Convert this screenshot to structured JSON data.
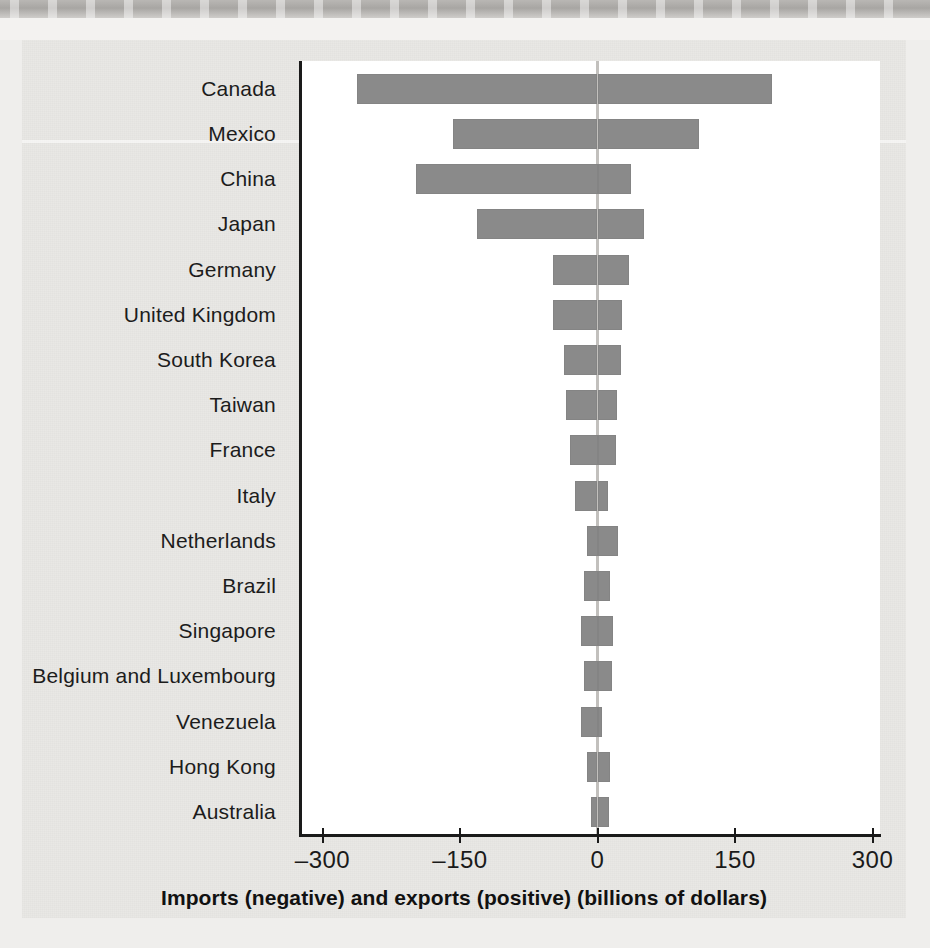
{
  "chart_data": {
    "type": "bar",
    "orientation": "horizontal",
    "title": "",
    "xlabel": "Imports (negative) and exports (positive) (billions of dollars)",
    "ylabel": "",
    "xlim": [
      -300,
      300
    ],
    "xticks": [
      -300,
      -150,
      0,
      150,
      300
    ],
    "xticklabels": [
      "–300",
      "–150",
      "0",
      "150",
      "300"
    ],
    "grid": false,
    "legend": null,
    "zero_line": 0,
    "bar_color": "#8a8a8a",
    "categories": [
      "Canada",
      "Mexico",
      "China",
      "Japan",
      "Germany",
      "United Kingdom",
      "South Korea",
      "Taiwan",
      "France",
      "Italy",
      "Netherlands",
      "Brazil",
      "Singapore",
      "Belgium and Luxembourg",
      "Venezuela",
      "Hong Kong",
      "Australia"
    ],
    "series": [
      {
        "name": "Imports (negative)",
        "values": [
          -262,
          -158,
          -198,
          -131,
          -49,
          -49,
          -37,
          -34,
          -30,
          -25,
          -12,
          -15,
          -18,
          -15,
          -18,
          -11,
          -7
        ]
      },
      {
        "name": "Exports (positive)",
        "values": [
          190,
          111,
          36,
          51,
          34,
          27,
          26,
          21,
          20,
          11,
          22,
          14,
          17,
          16,
          5,
          14,
          12
        ]
      }
    ],
    "rows": [
      {
        "label": "Canada",
        "import": -262,
        "export": 190
      },
      {
        "label": "Mexico",
        "import": -158,
        "export": 111
      },
      {
        "label": "China",
        "import": -198,
        "export": 36
      },
      {
        "label": "Japan",
        "import": -131,
        "export": 51
      },
      {
        "label": "Germany",
        "import": -49,
        "export": 34
      },
      {
        "label": "United Kingdom",
        "import": -49,
        "export": 27
      },
      {
        "label": "South Korea",
        "import": -37,
        "export": 26
      },
      {
        "label": "Taiwan",
        "import": -34,
        "export": 21
      },
      {
        "label": "France",
        "import": -30,
        "export": 20
      },
      {
        "label": "Italy",
        "import": -25,
        "export": 11
      },
      {
        "label": "Netherlands",
        "import": -12,
        "export": 22
      },
      {
        "label": "Brazil",
        "import": -15,
        "export": 14
      },
      {
        "label": "Singapore",
        "import": -18,
        "export": 17
      },
      {
        "label": "Belgium and Luxembourg",
        "import": -15,
        "export": 16
      },
      {
        "label": "Venezuela",
        "import": -18,
        "export": 5
      },
      {
        "label": "Hong Kong",
        "import": -11,
        "export": 14
      },
      {
        "label": "Australia",
        "import": -7,
        "export": 12
      }
    ]
  }
}
